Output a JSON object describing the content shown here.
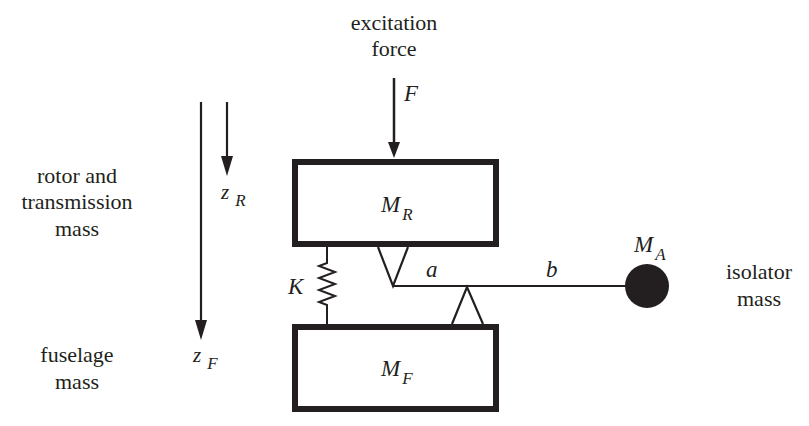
{
  "diagram": {
    "colors": {
      "ink": "#231f20",
      "background": "#ffffff"
    },
    "labels": {
      "excitation_force": [
        "excitation",
        "force"
      ],
      "force_symbol": "F",
      "rotor_desc": [
        "rotor and",
        "transmission",
        "mass"
      ],
      "fuselage_desc": [
        "fuselage",
        "mass"
      ],
      "isolator_desc": [
        "isolator",
        "mass"
      ],
      "z_R": {
        "main": "z",
        "sub": "R"
      },
      "z_F": {
        "main": "z",
        "sub": "F"
      },
      "M_R": {
        "main": "M",
        "sub": "R"
      },
      "M_F": {
        "main": "M",
        "sub": "F"
      },
      "M_A": {
        "main": "M",
        "sub": "A"
      },
      "spring": "K",
      "lever_arm_a": "a",
      "lever_arm_b": "b"
    },
    "components": [
      {
        "id": "rotor-mass-block",
        "label": "M_R"
      },
      {
        "id": "fuselage-mass-block",
        "label": "M_F"
      },
      {
        "id": "spring",
        "label": "K"
      },
      {
        "id": "lever-arm",
        "segments": [
          "a",
          "b"
        ]
      },
      {
        "id": "isolator-mass",
        "label": "M_A"
      },
      {
        "id": "excitation-arrow",
        "label": "F",
        "direction": "down"
      },
      {
        "id": "zR-arrow",
        "label": "z_R",
        "direction": "down"
      },
      {
        "id": "zF-arrow",
        "label": "z_F",
        "direction": "down"
      }
    ]
  }
}
